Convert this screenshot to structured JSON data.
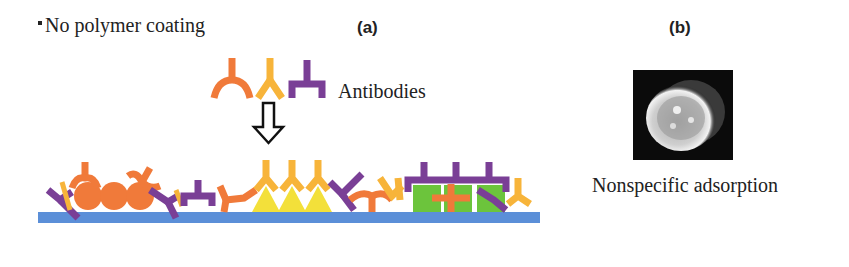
{
  "header": {
    "bullet_text": "No polymer coating",
    "panel_a_label": "(a)",
    "panel_b_label": "(b)"
  },
  "panel_a": {
    "legend_label": "Antibodies",
    "legend_icons": [
      "antibody-orange-icon",
      "antibody-yellow-icon",
      "antibody-purple-icon"
    ],
    "arrow_icon": "down-arrow-icon",
    "substrate": "substrate-surface",
    "adsorbed_shapes": [
      "orange-circles",
      "yellow-triangles",
      "green-squares"
    ]
  },
  "panel_b": {
    "image": "cell-micrograph",
    "caption": "Nonspecific adsorption"
  },
  "colors": {
    "orange": "#f07a3a",
    "yellow": "#f7b43a",
    "purple": "#7a3f96",
    "substrate": "#5b8fd8",
    "triangle": "#f3e03a",
    "square": "#6cc43c",
    "text": "#222222"
  }
}
